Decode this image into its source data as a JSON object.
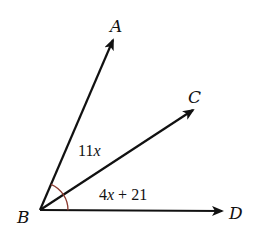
{
  "diagram": {
    "vertex": {
      "label": "B",
      "x": 40,
      "y": 210
    },
    "rays": [
      {
        "id": "BA",
        "label": "A",
        "tip": {
          "x": 113,
          "y": 40
        },
        "label_pos": {
          "x": 110,
          "y": 32
        }
      },
      {
        "id": "BC",
        "label": "C",
        "tip": {
          "x": 193,
          "y": 110
        },
        "label_pos": {
          "x": 190,
          "y": 102
        }
      },
      {
        "id": "BD",
        "label": "D",
        "tip": {
          "x": 222,
          "y": 211
        },
        "label_pos": {
          "x": 229,
          "y": 218
        }
      }
    ],
    "angle_labels": [
      {
        "id": "angle-ABC",
        "coef": "11",
        "var": "x",
        "pos": {
          "x": 78,
          "y": 155
        }
      },
      {
        "id": "angle-CBD",
        "coef": "4",
        "var": "x",
        "rest": " + 21",
        "pos": {
          "x": 98,
          "y": 199
        }
      }
    ],
    "arc": {
      "color": "#8b3a2f",
      "radius": 28
    },
    "colors": {
      "stroke": "#111111",
      "arc": "#8b3a2f",
      "background": "#ffffff"
    }
  }
}
